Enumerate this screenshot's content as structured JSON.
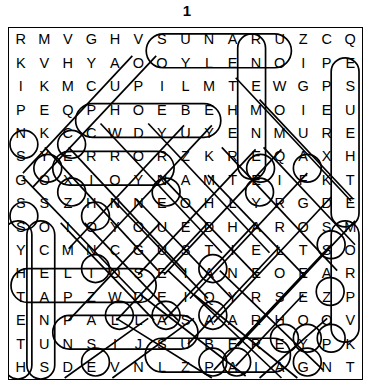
{
  "title": "1",
  "puzzle": {
    "type": "word-search",
    "rows": 15,
    "cols": 15,
    "grid": [
      [
        "R",
        "M",
        "V",
        "G",
        "H",
        "V",
        "S",
        "U",
        "N",
        "A",
        "R",
        "U",
        "Z",
        "C",
        "Q"
      ],
      [
        "K",
        "V",
        "H",
        "Y",
        "A",
        "O",
        "O",
        "Y",
        "L",
        "E",
        "N",
        "O",
        "I",
        "P",
        "E"
      ],
      [
        "I",
        "K",
        "M",
        "C",
        "U",
        "P",
        "I",
        "L",
        "M",
        "T",
        "E",
        "W",
        "G",
        "P",
        "S"
      ],
      [
        "P",
        "E",
        "Q",
        "P",
        "H",
        "O",
        "E",
        "B",
        "E",
        "H",
        "M",
        "O",
        "I",
        "E",
        "U"
      ],
      [
        "N",
        "K",
        "C",
        "C",
        "W",
        "D",
        "Y",
        "U",
        "Y",
        "E",
        "N",
        "M",
        "U",
        "R",
        "E"
      ],
      [
        "S",
        "Y",
        "E",
        "R",
        "R",
        "O",
        "R",
        "Z",
        "K",
        "R",
        "E",
        "Q",
        "A",
        "X",
        "H"
      ],
      [
        "G",
        "O",
        "X",
        "I",
        "O",
        "Y",
        "N",
        "A",
        "M",
        "T",
        "E",
        "I",
        "F",
        "K",
        "T"
      ],
      [
        "S",
        "S",
        "Z",
        "H",
        "N",
        "N",
        "E",
        "O",
        "H",
        "L",
        "Y",
        "R",
        "G",
        "D",
        "E"
      ],
      [
        "S",
        "O",
        "I",
        "O",
        "Y",
        "O",
        "U",
        "E",
        "D",
        "H",
        "A",
        "R",
        "O",
        "S",
        "M"
      ],
      [
        "Y",
        "C",
        "M",
        "N",
        "C",
        "G",
        "U",
        "S",
        "T",
        "I",
        "E",
        "L",
        "T",
        "S",
        "O"
      ],
      [
        "H",
        "E",
        "L",
        "I",
        "O",
        "S",
        "E",
        "I",
        "A",
        "N",
        "E",
        "O",
        "E",
        "A",
        "R"
      ],
      [
        "T",
        "A",
        "P",
        "Z",
        "W",
        "D",
        "E",
        "I",
        "Q",
        "Y",
        "R",
        "S",
        "E",
        "Z",
        "P"
      ],
      [
        "E",
        "N",
        "P",
        "A",
        "L",
        "L",
        "A",
        "S",
        "A",
        "A",
        "R",
        "H",
        "O",
        "O",
        "V"
      ],
      [
        "T",
        "U",
        "N",
        "S",
        "I",
        "J",
        "S",
        "U",
        "B",
        "E",
        "R",
        "E",
        "Y",
        "P",
        "K"
      ],
      [
        "H",
        "S",
        "D",
        "E",
        "V",
        "N",
        "L",
        "Z",
        "P",
        "A",
        "I",
        "A",
        "G",
        "N",
        "T"
      ]
    ],
    "found_words": [
      {
        "text": "URANUS",
        "direction": "horizontal-reverse",
        "row": 0,
        "start_col": 6,
        "end_col": 11
      },
      {
        "text": "PHOEBE",
        "direction": "horizontal",
        "row": 3,
        "start_col": 3,
        "end_col": 8
      },
      {
        "text": "ERROR",
        "direction": "horizontal",
        "row": 5,
        "start_col": 2,
        "end_col": 6
      },
      {
        "text": "HELIOS",
        "direction": "horizontal",
        "row": 10,
        "start_col": 0,
        "end_col": 5
      },
      {
        "text": "PALLAS",
        "direction": "horizontal",
        "row": 12,
        "start_col": 2,
        "end_col": 7
      },
      {
        "text": "SUBERE",
        "direction": "horizontal",
        "row": 13,
        "start_col": 6,
        "end_col": 11
      },
      {
        "text": "AETHER",
        "direction": "vertical",
        "col": 10,
        "start_row": 0,
        "end_row": 5
      },
      {
        "text": "OCEANUS",
        "direction": "vertical",
        "col": 1,
        "start_row": 8,
        "end_row": 14
      },
      {
        "text": "ESUEHTE",
        "direction": "vertical",
        "col": 14,
        "start_row": 1,
        "end_row": 8
      },
      {
        "text": "EMORP",
        "direction": "vertical",
        "col": 14,
        "start_row": 8,
        "end_row": 12
      },
      {
        "text": "STETH",
        "direction": "vertical",
        "col": 0,
        "start_row": 8,
        "end_row": 14
      }
    ],
    "colors": {
      "ink": "#000000",
      "background": "#ffffff",
      "mark_stroke": "#000000"
    }
  }
}
